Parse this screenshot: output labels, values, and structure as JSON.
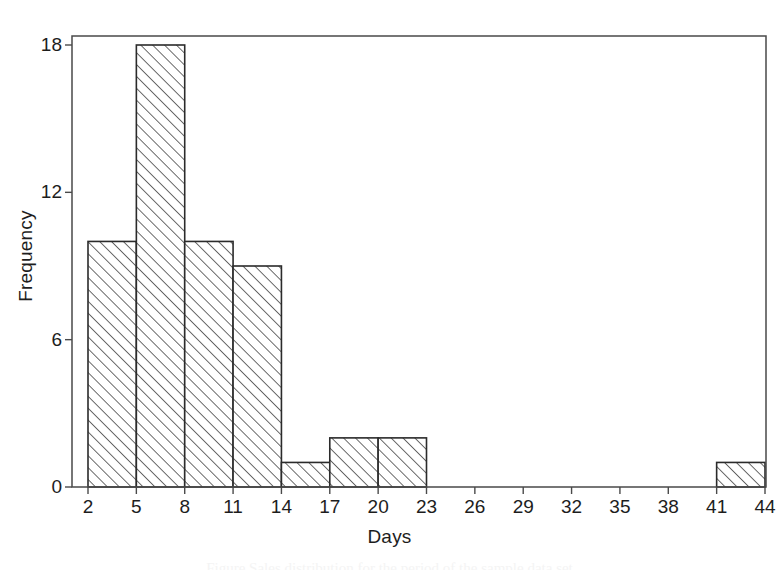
{
  "chart_data": {
    "type": "bar",
    "title": "",
    "subtitle": "",
    "xlabel": "Days",
    "ylabel": "Frequency",
    "xlim": [
      2,
      44
    ],
    "ylim": [
      0,
      18
    ],
    "bin_width": 3,
    "grid": false,
    "legend": null,
    "xticks": [
      2,
      5,
      8,
      11,
      14,
      17,
      20,
      23,
      26,
      29,
      32,
      35,
      38,
      41,
      44
    ],
    "xtick_labels": [
      "2",
      "5",
      "8",
      "11",
      "14",
      "17",
      "20",
      "23",
      "26",
      "29",
      "32",
      "35",
      "38",
      "41",
      "44"
    ],
    "yticks": [
      0,
      6,
      12,
      18
    ],
    "ytick_labels": [
      "0",
      "6",
      "12",
      "18"
    ],
    "categories": [
      "2-5",
      "5-8",
      "8-11",
      "11-14",
      "14-17",
      "17-20",
      "20-23",
      "23-26",
      "26-29",
      "29-32",
      "32-35",
      "35-38",
      "38-41",
      "41-44"
    ],
    "bins": [
      {
        "start": 2,
        "end": 5,
        "value": 10
      },
      {
        "start": 5,
        "end": 8,
        "value": 18
      },
      {
        "start": 8,
        "end": 11,
        "value": 10
      },
      {
        "start": 11,
        "end": 14,
        "value": 9
      },
      {
        "start": 14,
        "end": 17,
        "value": 1
      },
      {
        "start": 17,
        "end": 20,
        "value": 2
      },
      {
        "start": 20,
        "end": 23,
        "value": 2
      },
      {
        "start": 23,
        "end": 26,
        "value": 0
      },
      {
        "start": 26,
        "end": 29,
        "value": 0
      },
      {
        "start": 29,
        "end": 32,
        "value": 0
      },
      {
        "start": 32,
        "end": 35,
        "value": 0
      },
      {
        "start": 35,
        "end": 38,
        "value": 0
      },
      {
        "start": 38,
        "end": 41,
        "value": 0
      },
      {
        "start": 41,
        "end": 44,
        "value": 1
      }
    ],
    "values": [
      10,
      18,
      10,
      9,
      1,
      2,
      2,
      0,
      0,
      0,
      0,
      0,
      0,
      1
    ],
    "style": {
      "bar_fill": "#ffffff",
      "bar_edge": "#2b2b2b",
      "hatch": "diagonal-45",
      "hatch_color": "#3a3a3a",
      "frame_color": "#4a4a4a",
      "background": "#ffffff"
    }
  },
  "caption": {
    "partial_text": "Figure  Sales distribution for the period of the sample data set"
  }
}
